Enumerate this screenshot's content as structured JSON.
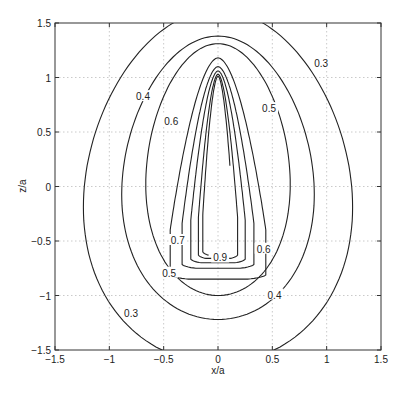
{
  "chart_data": {
    "type": "contour",
    "title": "",
    "xlabel": "x/a",
    "ylabel": "z/a",
    "xlim": [
      -1.5,
      1.5
    ],
    "ylim": [
      -1.5,
      1.5
    ],
    "grid": true,
    "xticks": [
      -1.5,
      -1,
      -0.5,
      0,
      0.5,
      1,
      1.5
    ],
    "yticks": [
      -1.5,
      -1,
      -0.5,
      0,
      0.5,
      1,
      1.5
    ],
    "xtick_labels": [
      "−1.5",
      "−1",
      "−0.5",
      "0",
      "0.5",
      "1",
      "1.5"
    ],
    "ytick_labels": [
      "−1.5",
      "−1",
      "−0.5",
      "0",
      "0.5",
      "1",
      "1.5"
    ],
    "contour_levels": [
      0.3,
      0.4,
      0.5,
      0.6,
      0.7,
      0.8,
      0.9,
      1.0
    ],
    "contours": [
      {
        "level": 0.3,
        "xmax": 1.23,
        "ztop": 1.62,
        "zbot": -1.62,
        "label": "0.3"
      },
      {
        "level": 0.4,
        "xmax": 0.88,
        "ztop": 1.38,
        "zbot": -1.22,
        "label": "0.4"
      },
      {
        "level": 0.5,
        "xmax": 0.66,
        "ztop": 1.31,
        "zbot": -1.0,
        "label": "0.5"
      },
      {
        "level": 0.6,
        "xmax": 0.44,
        "ztop": 1.18,
        "zbot": -0.85,
        "label": "0.6"
      },
      {
        "level": 0.7,
        "xmax": 0.33,
        "ztop": 1.1,
        "zbot": -0.75,
        "label": "0.7"
      },
      {
        "level": 0.8,
        "xmax": 0.25,
        "ztop": 1.06,
        "zbot": -0.7,
        "label": ""
      },
      {
        "level": 0.9,
        "xmax": 0.18,
        "ztop": 1.03,
        "zbot": -0.66,
        "label": "0.9"
      },
      {
        "level": 1.0,
        "xmax": 0.14,
        "ztop": 1.01,
        "zbot": -0.63,
        "label": ""
      }
    ],
    "labels_positions": [
      {
        "text": "0.3",
        "x": 0.95,
        "z": 1.12
      },
      {
        "text": "0.4",
        "x": -0.69,
        "z": 0.82
      },
      {
        "text": "0.5",
        "x": 0.47,
        "z": 0.71
      },
      {
        "text": "0.6",
        "x": -0.43,
        "z": 0.59
      },
      {
        "text": "0.7",
        "x": -0.37,
        "z": -0.5
      },
      {
        "text": "0.9",
        "x": 0.02,
        "z": -0.66
      },
      {
        "text": "0.6",
        "x": 0.42,
        "z": -0.58
      },
      {
        "text": "0.5",
        "x": -0.45,
        "z": -0.8
      },
      {
        "text": "0.4",
        "x": 0.52,
        "z": -1.0
      },
      {
        "text": "0.3",
        "x": -0.8,
        "z": -1.17
      }
    ]
  }
}
